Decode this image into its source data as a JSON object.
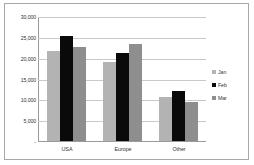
{
  "chart_data": {
    "type": "bar",
    "title": "",
    "xlabel": "",
    "ylabel": "",
    "categories": [
      "USA",
      "Europe",
      "Other"
    ],
    "series": [
      {
        "name": "Jan",
        "color": "#b3b3b3",
        "values": [
          21500,
          19000,
          10500
        ]
      },
      {
        "name": "Feb",
        "color": "#0a0a0a",
        "values": [
          25300,
          21200,
          12000
        ]
      },
      {
        "name": "Mar",
        "color": "#8e8e8e",
        "values": [
          22600,
          23300,
          9400
        ]
      }
    ],
    "ylim": [
      0,
      30000
    ],
    "yticks": [
      30000,
      25000,
      20000,
      15000,
      10000,
      5000,
      0
    ],
    "ytick_labels": [
      "30,000",
      "25,000",
      "20,000",
      "15,000",
      "10,000",
      "5,000",
      "-"
    ],
    "grid": true,
    "legend_position": "right"
  }
}
